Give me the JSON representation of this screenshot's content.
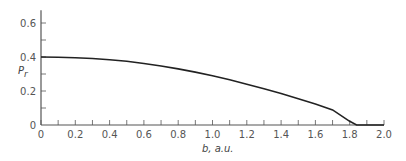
{
  "chart_data": {
    "type": "line",
    "title": "",
    "xlabel": "b, a.u.",
    "ylabel": "P_r",
    "ylabel_main": "P",
    "ylabel_sub": "r",
    "xlim": [
      0,
      2.0
    ],
    "ylim": [
      0,
      0.675
    ],
    "x_ticks": [
      "0",
      "0.2",
      "0.4",
      "0.6",
      "0.8",
      "1.0",
      "1.2",
      "1.4",
      "1.6",
      "1.8",
      "2.0"
    ],
    "x_minor_step": 0.1,
    "y_ticks": [
      "0",
      "0.2",
      "0.4",
      "0.6"
    ],
    "y_minor_step": 0.1,
    "grid": false,
    "legend": null,
    "series": [
      {
        "name": "P_r",
        "color": "#222222",
        "x": [
          0,
          0.1,
          0.2,
          0.3,
          0.4,
          0.5,
          0.6,
          0.7,
          0.8,
          0.9,
          1.0,
          1.1,
          1.2,
          1.3,
          1.4,
          1.5,
          1.6,
          1.7,
          1.8,
          1.84,
          1.9,
          2.0
        ],
        "y": [
          0.4,
          0.399,
          0.396,
          0.391,
          0.384,
          0.375,
          0.362,
          0.347,
          0.33,
          0.311,
          0.29,
          0.266,
          0.24,
          0.213,
          0.185,
          0.155,
          0.123,
          0.089,
          0.022,
          0.0,
          0.0,
          0.0
        ]
      }
    ]
  },
  "colors": {
    "axis": "#555555",
    "curve": "#222222",
    "text": "#555555"
  }
}
